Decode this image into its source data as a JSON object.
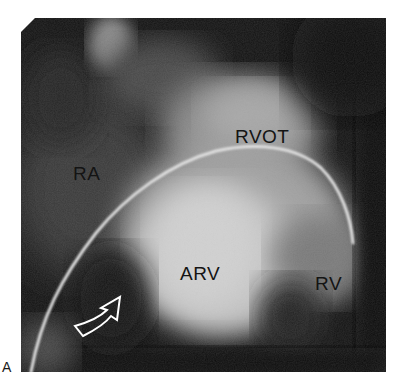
{
  "figure": {
    "panel_letter": "A",
    "image_type": "right ventricular angiogram",
    "labels": {
      "rvot": "RVOT",
      "ra": "RA",
      "arv": "ARV",
      "rv": "RV"
    },
    "annotations": [
      {
        "type": "curved-arrow",
        "style": "hollow white outline",
        "points_to": "ARV"
      }
    ],
    "colors": {
      "background": "#ffffff",
      "image_dark": "#0a0a0a",
      "contrast_bright": "#d8d8d8",
      "label_text": "#141414",
      "arrow_outline": "#ffffff"
    }
  }
}
